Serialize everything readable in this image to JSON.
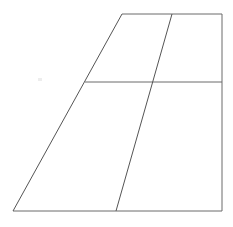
{
  "figure": {
    "canvas": {
      "width": 233,
      "height": 227,
      "background_color": "#ffffff"
    },
    "style": {
      "stroke_color": "#6b6b6b",
      "stroke_color_dark": "#555555",
      "stroke_width": 1,
      "fill_color": "#ffffff",
      "speck_color": "#ededed"
    },
    "vertices": {
      "top_left": {
        "label": "A",
        "x": 122,
        "y": 14
      },
      "top_right": {
        "label": "B",
        "x": 222,
        "y": 14
      },
      "bottom_right": {
        "label": "C",
        "x": 222,
        "y": 211
      },
      "bottom_left": {
        "label": "D",
        "x": 13,
        "y": 211
      },
      "top_interior": {
        "label": "E",
        "x": 172,
        "y": 14
      },
      "bottom_interior": {
        "label": "F",
        "x": 116,
        "y": 211
      },
      "left_mid": {
        "label": "G",
        "x": 85,
        "y": 82
      },
      "right_mid": {
        "label": "H",
        "x": 222,
        "y": 82
      },
      "crossing": {
        "label": "I",
        "x": 150,
        "y": 82
      }
    },
    "outline_points": "122,14 222,14 222,211 13,211",
    "edges": [
      {
        "name": "top-edge",
        "from": "top_left",
        "to": "top_right",
        "x1": 122,
        "y1": 14,
        "x2": 222,
        "y2": 14,
        "orientation": "horizontal",
        "color": "#6b6b6b"
      },
      {
        "name": "right-edge",
        "from": "top_right",
        "to": "bottom_right",
        "x1": 222,
        "y1": 14,
        "x2": 222,
        "y2": 211,
        "orientation": "vertical",
        "color": "#6b6b6b"
      },
      {
        "name": "bottom-edge",
        "from": "bottom_right",
        "to": "bottom_left",
        "x1": 222,
        "y1": 211,
        "x2": 13,
        "y2": 211,
        "orientation": "horizontal",
        "color": "#6b6b6b"
      },
      {
        "name": "left-slanted-edge",
        "from": "bottom_left",
        "to": "top_left",
        "x1": 13,
        "y1": 211,
        "x2": 122,
        "y2": 14,
        "orientation": "diagonal",
        "color": "#555555"
      }
    ],
    "interior_lines": [
      {
        "name": "horizontal-divider",
        "from": "left_mid",
        "to": "right_mid",
        "x1": 85,
        "y1": 82,
        "x2": 222,
        "y2": 82,
        "orientation": "horizontal",
        "color": "#6b6b6b"
      },
      {
        "name": "diagonal-divider",
        "from": "top_interior",
        "to": "bottom_interior",
        "x1": 172,
        "y1": 14,
        "x2": 116,
        "y2": 211,
        "orientation": "diagonal",
        "color": "#555555"
      }
    ],
    "regions": [
      {
        "name": "upper-left-region",
        "points": "122,14 172,14 150,82 85,82"
      },
      {
        "name": "upper-right-region",
        "points": "172,14 222,14 222,82 150,82"
      },
      {
        "name": "lower-left-region",
        "points": "85,82 150,82 116,211 13,211"
      },
      {
        "name": "lower-right-region",
        "points": "150,82 222,82 222,211 116,211"
      }
    ],
    "artifacts": [
      {
        "name": "faint-speck",
        "x": 38,
        "y": 78,
        "width": 4,
        "height": 3
      }
    ]
  }
}
